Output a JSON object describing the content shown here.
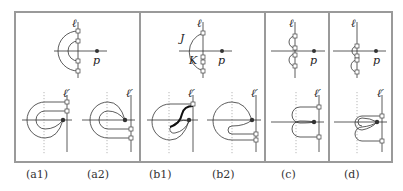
{
  "figure": {
    "panels": [
      {
        "id": "a1",
        "caption": "(a1)"
      },
      {
        "id": "a2",
        "caption": "(a2)"
      },
      {
        "id": "b1",
        "caption": "(b1)"
      },
      {
        "id": "b2",
        "caption": "(b2)"
      },
      {
        "id": "c",
        "caption": "(c)"
      },
      {
        "id": "d",
        "caption": "(d)"
      }
    ],
    "labels": {
      "ell": "ℓ",
      "ell_prime": "ℓ′",
      "p": "p",
      "J": "J",
      "K": "K"
    },
    "colors": {
      "frame": "#9a9a9a",
      "stroke": "#333333"
    }
  }
}
